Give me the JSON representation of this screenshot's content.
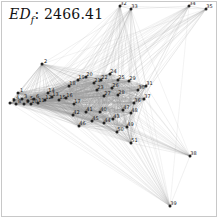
{
  "figure": {
    "title_metric": "ED",
    "title_subscript": "f",
    "title_separator": ": ",
    "title_value": "2466.41",
    "background_color": "#ffffff",
    "border_color": "#c8c8c8",
    "edge_color": "#999999",
    "node_color": "#222222",
    "label_color": "#1a1a1a"
  },
  "chart_data": {
    "type": "scatter",
    "title": "EDf: 2466.41",
    "xlabel": "",
    "ylabel": "",
    "grid": false,
    "legend": "none",
    "xlim": [
      0,
      218
    ],
    "ylim": [
      0,
      218
    ],
    "node_count": 39,
    "nodes": [
      {
        "id": "1",
        "x": 18,
        "y": 93
      },
      {
        "id": "2",
        "x": 42,
        "y": 64
      },
      {
        "id": "3",
        "x": 22,
        "y": 99
      },
      {
        "id": "4",
        "x": 14,
        "y": 100
      },
      {
        "id": "5",
        "x": 28,
        "y": 101
      },
      {
        "id": "6",
        "x": 34,
        "y": 99
      },
      {
        "id": "7",
        "x": 10,
        "y": 103
      },
      {
        "id": "8",
        "x": 16,
        "y": 104
      },
      {
        "id": "9",
        "x": 24,
        "y": 104
      },
      {
        "id": "10",
        "x": 31,
        "y": 104
      },
      {
        "id": "11",
        "x": 38,
        "y": 103
      },
      {
        "id": "12",
        "x": 45,
        "y": 100
      },
      {
        "id": "13",
        "x": 52,
        "y": 97
      },
      {
        "id": "14",
        "x": 48,
        "y": 93
      },
      {
        "id": "15",
        "x": 59,
        "y": 100
      },
      {
        "id": "16",
        "x": 66,
        "y": 98
      },
      {
        "id": "17",
        "x": 74,
        "y": 104
      },
      {
        "id": "18",
        "x": 69,
        "y": 86
      },
      {
        "id": "19",
        "x": 78,
        "y": 80
      },
      {
        "id": "20",
        "x": 86,
        "y": 77
      },
      {
        "id": "21",
        "x": 94,
        "y": 83
      },
      {
        "id": "22",
        "x": 101,
        "y": 80
      },
      {
        "id": "23",
        "x": 97,
        "y": 90
      },
      {
        "id": "24",
        "x": 110,
        "y": 74
      },
      {
        "id": "25",
        "x": 118,
        "y": 80
      },
      {
        "id": "26",
        "x": 112,
        "y": 88
      },
      {
        "id": "27",
        "x": 104,
        "y": 96
      },
      {
        "id": "28",
        "x": 118,
        "y": 95
      },
      {
        "id": "29",
        "x": 129,
        "y": 81
      },
      {
        "id": "30",
        "x": 138,
        "y": 90
      },
      {
        "id": "31",
        "x": 146,
        "y": 86
      },
      {
        "id": "32",
        "x": 120,
        "y": 6
      },
      {
        "id": "33",
        "x": 131,
        "y": 9
      },
      {
        "id": "34",
        "x": 189,
        "y": 6
      },
      {
        "id": "35",
        "x": 206,
        "y": 9
      },
      {
        "id": "36",
        "x": 134,
        "y": 103
      },
      {
        "id": "37",
        "x": 144,
        "y": 99
      },
      {
        "id": "38",
        "x": 190,
        "y": 156
      },
      {
        "id": "39",
        "x": 170,
        "y": 206
      }
    ],
    "extra_labels": [
      {
        "id": "40",
        "x": 100,
        "y": 112
      },
      {
        "id": "41",
        "x": 86,
        "y": 112
      },
      {
        "id": "42",
        "x": 73,
        "y": 115
      },
      {
        "id": "43",
        "x": 113,
        "y": 119
      },
      {
        "id": "44",
        "x": 104,
        "y": 123
      },
      {
        "id": "45",
        "x": 92,
        "y": 121
      },
      {
        "id": "46",
        "x": 79,
        "y": 126
      },
      {
        "id": "47",
        "x": 123,
        "y": 110
      },
      {
        "id": "48",
        "x": 131,
        "y": 113
      },
      {
        "id": "49",
        "x": 127,
        "y": 127
      },
      {
        "id": "50",
        "x": 117,
        "y": 132
      },
      {
        "id": "51",
        "x": 131,
        "y": 143
      }
    ],
    "edge_count_approx": 420
  }
}
